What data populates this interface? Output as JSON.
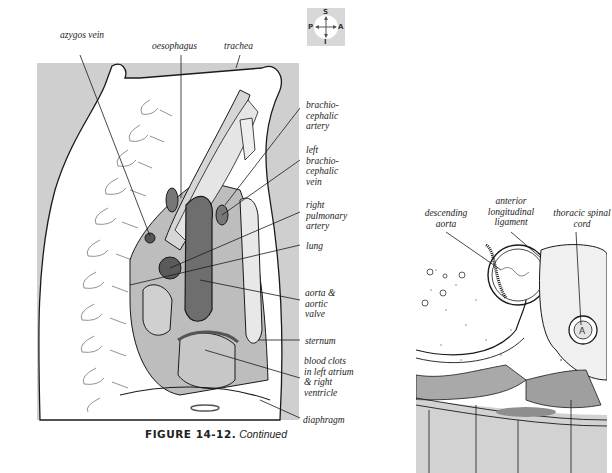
{
  "figure": {
    "number": "FIGURE 14-12.",
    "caption_suffix": "Continued"
  },
  "orientation_key": {
    "top": "S",
    "left": "P",
    "right": "A",
    "bottom": "I"
  },
  "sagittal_view": {
    "top_labels": [
      {
        "id": "azygos",
        "text": "azygos vein"
      },
      {
        "id": "oesophagus",
        "text": "oesophagus"
      },
      {
        "id": "trachea",
        "text": "trachea"
      }
    ],
    "right_labels": [
      {
        "id": "brachio-artery",
        "text": "brachio-cephalic artery"
      },
      {
        "id": "brachio-vein",
        "text": "left brachio-cephalic vein"
      },
      {
        "id": "rpa",
        "text": "right pulmonary artery"
      },
      {
        "id": "lung",
        "text": "lung"
      },
      {
        "id": "aorta",
        "text": "aorta & aortic valve"
      },
      {
        "id": "sternum",
        "text": "sternum"
      },
      {
        "id": "clots",
        "text": "blood clots in left atrium & right ventricle"
      },
      {
        "id": "diaphragm",
        "text": "diaphragm"
      }
    ]
  },
  "axial_view": {
    "top_labels": [
      {
        "id": "desc-aorta",
        "text": "descending aorta"
      },
      {
        "id": "ant-ligament",
        "text": "anterior longitudinal ligament"
      },
      {
        "id": "spinal-cord",
        "text": "thoracic spinal cord"
      }
    ]
  },
  "colors": {
    "background_gray": "#cfcfcf",
    "dark_organ": "#6e6e6e",
    "medium_organ": "#a9a9a9",
    "light_organ": "#d9d9d9",
    "line": "#1a1a1a"
  }
}
